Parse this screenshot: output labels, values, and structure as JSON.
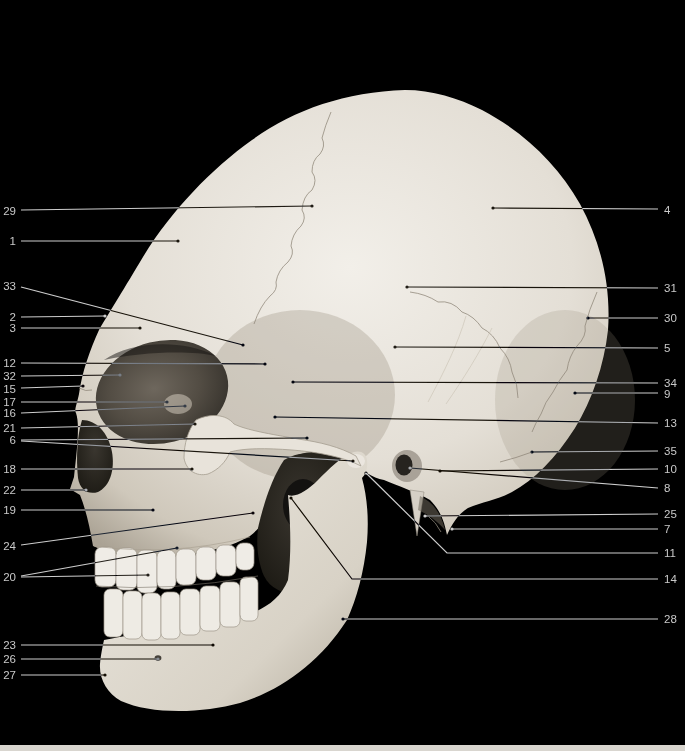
{
  "figure": {
    "background_color": "#000000",
    "page_strip_color": "#d9d6d0",
    "label_color": "#c9c9c9",
    "leader_color": "#cdcdcd",
    "labels": [
      {
        "n": "29",
        "side": "left",
        "tx": 16,
        "ty": 211,
        "leaders": [
          [
            [
              21,
              210
            ],
            [
              312,
              206
            ]
          ]
        ]
      },
      {
        "n": "1",
        "side": "left",
        "tx": 16,
        "ty": 241,
        "leaders": [
          [
            [
              21,
              241
            ],
            [
              178,
              241
            ]
          ]
        ]
      },
      {
        "n": "33",
        "side": "left",
        "tx": 16,
        "ty": 286,
        "leaders": [
          [
            [
              21,
              287
            ],
            [
              243,
              345
            ]
          ]
        ]
      },
      {
        "n": "2",
        "side": "left",
        "tx": 16,
        "ty": 317,
        "leaders": [
          [
            [
              21,
              317
            ],
            [
              105,
              316
            ]
          ]
        ]
      },
      {
        "n": "3",
        "side": "left",
        "tx": 16,
        "ty": 328,
        "leaders": [
          [
            [
              21,
              328
            ],
            [
              140,
              328
            ]
          ]
        ]
      },
      {
        "n": "12",
        "side": "left",
        "tx": 16,
        "ty": 363,
        "leaders": [
          [
            [
              21,
              363
            ],
            [
              265,
              364
            ]
          ]
        ]
      },
      {
        "n": "32",
        "side": "left",
        "tx": 16,
        "ty": 376,
        "leaders": [
          [
            [
              21,
              376
            ],
            [
              120,
              375
            ]
          ]
        ]
      },
      {
        "n": "15",
        "side": "left",
        "tx": 16,
        "ty": 389,
        "leaders": [
          [
            [
              21,
              388
            ],
            [
              83,
              386
            ]
          ]
        ]
      },
      {
        "n": "17",
        "side": "left",
        "tx": 16,
        "ty": 402,
        "leaders": [
          [
            [
              21,
              402
            ],
            [
              167,
              402
            ]
          ]
        ]
      },
      {
        "n": "16",
        "side": "left",
        "tx": 16,
        "ty": 413,
        "leaders": [
          [
            [
              21,
              413
            ],
            [
              185,
              406
            ]
          ]
        ]
      },
      {
        "n": "21",
        "side": "left",
        "tx": 16,
        "ty": 428,
        "leaders": [
          [
            [
              21,
              428
            ],
            [
              195,
              424
            ]
          ]
        ]
      },
      {
        "n": "6",
        "side": "left",
        "tx": 16,
        "ty": 440,
        "leaders": [
          [
            [
              21,
              440
            ],
            [
              307,
              438
            ]
          ],
          [
            [
              21,
              441
            ],
            [
              353,
              461
            ]
          ]
        ]
      },
      {
        "n": "18",
        "side": "left",
        "tx": 16,
        "ty": 469,
        "leaders": [
          [
            [
              21,
              469
            ],
            [
              192,
              469
            ]
          ]
        ]
      },
      {
        "n": "22",
        "side": "left",
        "tx": 16,
        "ty": 490,
        "leaders": [
          [
            [
              21,
              490
            ],
            [
              86,
              490
            ]
          ]
        ]
      },
      {
        "n": "19",
        "side": "left",
        "tx": 16,
        "ty": 510,
        "leaders": [
          [
            [
              21,
              510
            ],
            [
              153,
              510
            ]
          ]
        ]
      },
      {
        "n": "24",
        "side": "left",
        "tx": 16,
        "ty": 546,
        "leaders": [
          [
            [
              21,
              545
            ],
            [
              253,
              513
            ]
          ]
        ]
      },
      {
        "n": "20",
        "side": "left",
        "tx": 16,
        "ty": 577,
        "leaders": [
          [
            [
              21,
              576
            ],
            [
              177,
              548
            ]
          ],
          [
            [
              21,
              577
            ],
            [
              148,
              575
            ]
          ]
        ]
      },
      {
        "n": "23",
        "side": "left",
        "tx": 16,
        "ty": 645,
        "leaders": [
          [
            [
              21,
              645
            ],
            [
              213,
              645
            ]
          ]
        ]
      },
      {
        "n": "26",
        "side": "left",
        "tx": 16,
        "ty": 659,
        "leaders": [
          [
            [
              21,
              659
            ],
            [
              158,
              659
            ]
          ]
        ]
      },
      {
        "n": "27",
        "side": "left",
        "tx": 16,
        "ty": 675,
        "leaders": [
          [
            [
              21,
              675
            ],
            [
              105,
              675
            ]
          ]
        ]
      },
      {
        "n": "4",
        "side": "right",
        "tx": 664,
        "ty": 210,
        "leaders": [
          [
            [
              658,
              209
            ],
            [
              493,
              208
            ]
          ]
        ]
      },
      {
        "n": "31",
        "side": "right",
        "tx": 664,
        "ty": 288,
        "leaders": [
          [
            [
              658,
              288
            ],
            [
              407,
              287
            ]
          ]
        ]
      },
      {
        "n": "30",
        "side": "right",
        "tx": 664,
        "ty": 318,
        "leaders": [
          [
            [
              658,
              318
            ],
            [
              588,
              318
            ]
          ]
        ]
      },
      {
        "n": "5",
        "side": "right",
        "tx": 664,
        "ty": 348,
        "leaders": [
          [
            [
              658,
              348
            ],
            [
              395,
              347
            ]
          ]
        ]
      },
      {
        "n": "34",
        "side": "right",
        "tx": 664,
        "ty": 383,
        "leaders": [
          [
            [
              658,
              383
            ],
            [
              293,
              382
            ]
          ]
        ]
      },
      {
        "n": "9",
        "side": "right",
        "tx": 664,
        "ty": 394,
        "leaders": [
          [
            [
              658,
              393
            ],
            [
              575,
              393
            ]
          ]
        ]
      },
      {
        "n": "13",
        "side": "right",
        "tx": 664,
        "ty": 423,
        "leaders": [
          [
            [
              658,
              423
            ],
            [
              275,
              417
            ]
          ]
        ]
      },
      {
        "n": "35",
        "side": "right",
        "tx": 664,
        "ty": 451,
        "leaders": [
          [
            [
              658,
              451
            ],
            [
              532,
              452
            ]
          ]
        ]
      },
      {
        "n": "10",
        "side": "right",
        "tx": 664,
        "ty": 469,
        "leaders": [
          [
            [
              658,
              469
            ],
            [
              440,
              471
            ]
          ]
        ]
      },
      {
        "n": "8",
        "side": "right",
        "tx": 664,
        "ty": 488,
        "leaders": [
          [
            [
              658,
              488
            ],
            [
              410,
              468
            ]
          ]
        ]
      },
      {
        "n": "25",
        "side": "right",
        "tx": 664,
        "ty": 514,
        "leaders": [
          [
            [
              658,
              514
            ],
            [
              425,
              516
            ]
          ]
        ]
      },
      {
        "n": "7",
        "side": "right",
        "tx": 664,
        "ty": 529,
        "leaders": [
          [
            [
              658,
              529
            ],
            [
              452,
              529
            ]
          ]
        ]
      },
      {
        "n": "11",
        "side": "right",
        "tx": 664,
        "ty": 553,
        "leaders": [
          [
            [
              658,
              553
            ],
            [
              447,
              553
            ],
            [
              366,
              473
            ]
          ]
        ]
      },
      {
        "n": "14",
        "side": "right",
        "tx": 664,
        "ty": 579,
        "leaders": [
          [
            [
              658,
              579
            ],
            [
              352,
              579
            ],
            [
              291,
              498
            ]
          ]
        ]
      },
      {
        "n": "28",
        "side": "right",
        "tx": 664,
        "ty": 619,
        "leaders": [
          [
            [
              658,
              619
            ],
            [
              343,
              619
            ]
          ]
        ]
      }
    ]
  }
}
